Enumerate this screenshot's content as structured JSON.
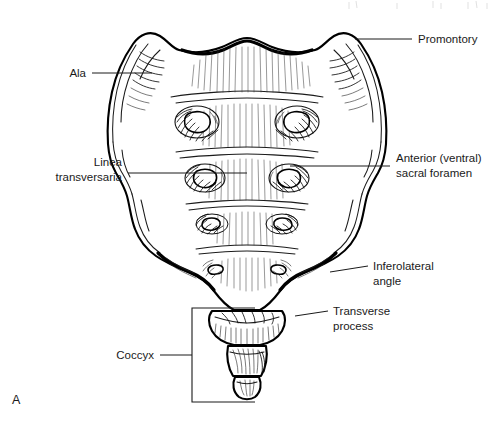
{
  "figure": {
    "letter": "A",
    "ink_color": "#1a1a1a",
    "background_color": "#ffffff"
  },
  "labels": {
    "promontory": "Promontory",
    "ala": "Ala",
    "linea_transversaria_line1": "Linea",
    "linea_transversaria_line2": "transversaria",
    "anterior_sacral_foramen_line1": "Anterior (ventral)",
    "anterior_sacral_foramen_line2": "sacral foramen",
    "inferolateral_angle_line1": "Inferolateral",
    "inferolateral_angle_line2": "angle",
    "transverse_process_line1": "Transverse",
    "transverse_process_line2": "process",
    "coccyx": "Coccyx"
  }
}
